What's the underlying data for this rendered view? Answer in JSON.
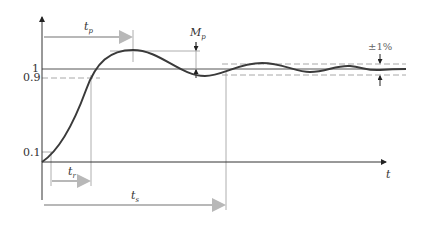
{
  "diagram": {
    "y_ticks": [
      {
        "label": "1",
        "value": 1.0
      },
      {
        "label": "0.9",
        "value": 0.9
      },
      {
        "label": "0.1",
        "value": 0.1
      }
    ],
    "x_axis_label": "t",
    "annotations": {
      "peak_time": {
        "symbol": "t",
        "subscript": "p"
      },
      "overshoot": {
        "symbol": "M",
        "subscript": "p"
      },
      "rise_time": {
        "symbol": "t",
        "subscript": "r"
      },
      "settling_time": {
        "symbol": "t",
        "subscript": "s"
      },
      "tolerance_band": "±1%"
    },
    "colors": {
      "curve": "#3a3a3a",
      "axis": "#333333",
      "guide": "#8a8a8a",
      "arrow": "#b8b8b8",
      "dashed": "#a8a8a8"
    }
  }
}
